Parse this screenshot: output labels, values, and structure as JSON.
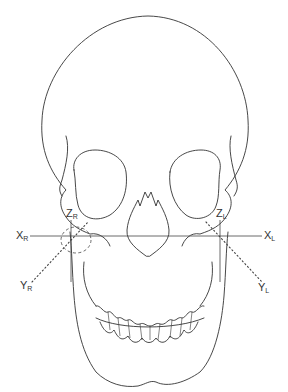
{
  "figure": {
    "labels": {
      "x_right": {
        "main": "X",
        "sub": "R"
      },
      "x_left": {
        "main": "X",
        "sub": "L"
      },
      "y_right": {
        "main": "Y",
        "sub": "R"
      },
      "y_left": {
        "main": "Y",
        "sub": "L"
      },
      "z_right": {
        "main": "Z",
        "sub": "R"
      },
      "z_left": {
        "main": "Z",
        "sub": "L"
      }
    },
    "colors": {
      "line": "#333333",
      "background": "#ffffff"
    }
  }
}
